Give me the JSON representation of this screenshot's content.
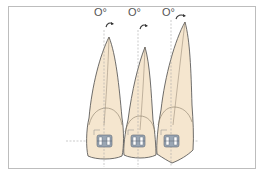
{
  "diagram": {
    "labels": [
      {
        "id": "tooth-1-angle",
        "text": "O°"
      },
      {
        "id": "tooth-2-angle",
        "text": "O°"
      },
      {
        "id": "tooth-3-angle",
        "text": "O°"
      }
    ],
    "teeth": [
      {
        "name": "central-incisor",
        "angle": "0°"
      },
      {
        "name": "lateral-incisor",
        "angle": "0°"
      },
      {
        "name": "canine",
        "angle": "0°"
      }
    ],
    "colors": {
      "tooth_fill": "#f5e6cf",
      "outline": "#4a4a4a",
      "crown_line": "#8a7d6a",
      "dashed_line": "#a8a8a8",
      "bracket": "#9aa6b4",
      "bracket_outline": "#5c6672",
      "frame": "#bdbdbd"
    }
  }
}
